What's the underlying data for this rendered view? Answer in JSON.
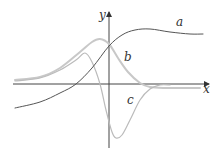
{
  "diagram": {
    "axes": {
      "x_label": "x",
      "y_label": "y",
      "axis_color": "#444444"
    },
    "curves": [
      {
        "label": "a",
        "color": "#555555",
        "stroke_width": 1,
        "points": [
          [
            15,
            108
          ],
          [
            40,
            102
          ],
          [
            60,
            93
          ],
          [
            76,
            84
          ],
          [
            92,
            68
          ],
          [
            109,
            46
          ],
          [
            122,
            35
          ],
          [
            135,
            30
          ],
          [
            150,
            29
          ],
          [
            170,
            32
          ],
          [
            190,
            34
          ],
          [
            203,
            34
          ]
        ]
      },
      {
        "label": "b",
        "color": "#c8c8c8",
        "stroke_width": 2,
        "points": [
          [
            15,
            80
          ],
          [
            40,
            77
          ],
          [
            60,
            68
          ],
          [
            80,
            52
          ],
          [
            92,
            42
          ],
          [
            100,
            39
          ],
          [
            109,
            44
          ],
          [
            118,
            58
          ],
          [
            128,
            72
          ],
          [
            140,
            83
          ],
          [
            150,
            87
          ],
          [
            165,
            88
          ],
          [
            200,
            88
          ]
        ]
      },
      {
        "label": "c",
        "color": "#bbbbbb",
        "stroke_width": 1.2,
        "points": [
          [
            15,
            81
          ],
          [
            40,
            78
          ],
          [
            60,
            70
          ],
          [
            76,
            60
          ],
          [
            85,
            53
          ],
          [
            92,
            62
          ],
          [
            100,
            84
          ],
          [
            106,
            110
          ],
          [
            112,
            132
          ],
          [
            116,
            138
          ],
          [
            122,
            135
          ],
          [
            130,
            120
          ],
          [
            140,
            100
          ],
          [
            150,
            89
          ],
          [
            160,
            85
          ],
          [
            170,
            85
          ]
        ]
      }
    ],
    "label_positions": {
      "a": [
        176,
        26
      ],
      "b": [
        124,
        61
      ],
      "c": [
        127,
        104
      ],
      "x": [
        203,
        93
      ],
      "y": [
        99,
        19
      ]
    }
  }
}
